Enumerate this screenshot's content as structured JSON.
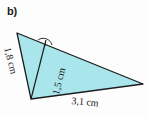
{
  "figure": {
    "label": "b)",
    "caption": "",
    "background_color": "#fdfdfd",
    "fill_color": "#a9e6ec",
    "stroke_color": "#1c1c1c",
    "text_color": "#1b1b1b"
  },
  "shape": {
    "type": "triangle",
    "vertices": [
      {
        "name": "top",
        "x": 17,
        "y": 33
      },
      {
        "name": "right",
        "x": 143,
        "y": 84
      },
      {
        "name": "bottom-left",
        "x": 31,
        "y": 99
      }
    ],
    "altitude": {
      "from": {
        "x": 31,
        "y": 99
      },
      "to": {
        "x": 46,
        "y": 40
      }
    },
    "right_angle_marker": {
      "at": {
        "x": 46,
        "y": 40
      },
      "glyph": "·"
    }
  },
  "measurements": {
    "side_left": "1,8 cm",
    "side_height": "1,5 cm",
    "side_base": "3,1 cm"
  }
}
